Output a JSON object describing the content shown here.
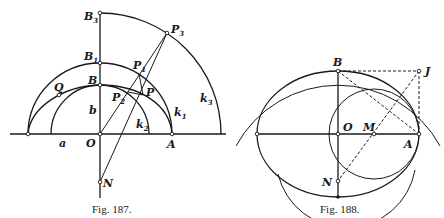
{
  "figures": [
    {
      "caption": "Fig. 187.",
      "labels": {
        "B3": "B",
        "B3_sub": "3",
        "P3": "P",
        "P3_sub": "3",
        "B1": "B",
        "B1_sub": "1",
        "P1": "P",
        "P1_sub": "1",
        "B": "B",
        "Q": "Q",
        "P": "P",
        "P2": "P",
        "P2_sub": "2",
        "b": "b",
        "a": "a",
        "O": "O",
        "A": "A",
        "N": "N",
        "k1": "k",
        "k1_sub": "1",
        "k2": "k",
        "k2_sub": "2",
        "k3": "k",
        "k3_sub": "3"
      }
    },
    {
      "caption": "Fig. 188.",
      "labels": {
        "B": "B",
        "J": "J",
        "O": "O",
        "M": "M",
        "A": "A",
        "N": "N"
      }
    }
  ],
  "colors": {
    "ink": "#1a1a1a",
    "background": "#ffffff"
  }
}
